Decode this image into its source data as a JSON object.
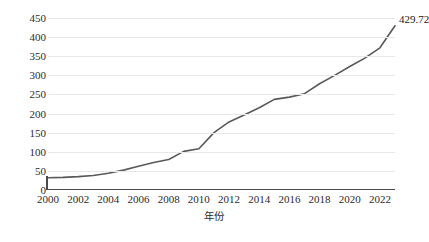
{
  "chart_data": {
    "type": "line",
    "title": "",
    "xlabel": "年份",
    "ylabel": "GDP（10亿美元）",
    "x": [
      2000,
      2001,
      2002,
      2003,
      2004,
      2005,
      2006,
      2007,
      2008,
      2009,
      2010,
      2011,
      2012,
      2013,
      2014,
      2015,
      2016,
      2017,
      2018,
      2019,
      2020,
      2021,
      2022,
      2023
    ],
    "values": [
      32,
      33,
      35,
      38,
      44,
      52,
      62,
      72,
      80,
      101,
      108,
      150,
      178,
      196,
      215,
      237,
      243,
      252,
      278,
      300,
      323,
      345,
      372,
      429.72
    ],
    "series": [
      {
        "name": "GDP",
        "values": [
          32,
          33,
          35,
          38,
          44,
          52,
          62,
          72,
          80,
          101,
          108,
          150,
          178,
          196,
          215,
          237,
          243,
          252,
          278,
          300,
          323,
          345,
          372,
          429.72
        ]
      }
    ],
    "xlim": [
      2000,
      2023
    ],
    "ylim": [
      0,
      450
    ],
    "ytick_labels": [
      "0",
      "50",
      "100",
      "150",
      "200",
      "250",
      "300",
      "350",
      "400",
      "450"
    ],
    "ytick_values": [
      0,
      50,
      100,
      150,
      200,
      250,
      300,
      350,
      400,
      450
    ],
    "xtick_labels": [
      "2000",
      "2002",
      "2004",
      "2006",
      "2008",
      "2010",
      "2012",
      "2014",
      "2016",
      "2018",
      "2020",
      "2022"
    ],
    "xtick_values": [
      2000,
      2002,
      2004,
      2006,
      2008,
      2010,
      2012,
      2014,
      2016,
      2018,
      2020,
      2022
    ],
    "grid": "horizontal",
    "legend": "none",
    "annotations": [
      {
        "text": "429.72",
        "x": 2023,
        "y": 429.72
      }
    ],
    "line_color": "#595959",
    "grid_color": "#e8e8e8",
    "axis_color": "#4a4a4a",
    "text_color": "#2b2b2b"
  }
}
